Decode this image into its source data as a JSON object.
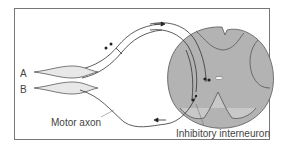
{
  "figure": {
    "labels": {
      "muscle_a": "A",
      "muscle_b": "B",
      "motor_axon": "Motor axon",
      "inhibitory_interneuron": "Inhibitory interneuron"
    },
    "colors": {
      "spinal_cord_fill": "#b3b3b3",
      "outline": "#444444",
      "background": "#ffffff",
      "frame": "#777777"
    }
  }
}
